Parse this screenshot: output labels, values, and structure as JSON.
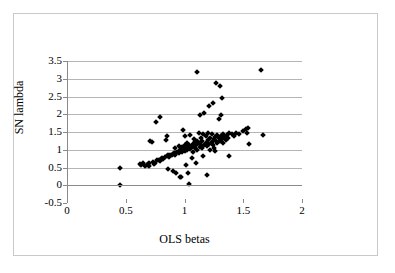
{
  "chart_data": {
    "type": "scatter",
    "title": "",
    "xlabel": "OLS betas",
    "ylabel": "SN lambda",
    "xlim": [
      0,
      2
    ],
    "ylim": [
      -0.5,
      3.5
    ],
    "xticks": [
      0,
      0.5,
      1,
      1.5,
      2
    ],
    "xtick_labels": [
      "0",
      "0.5",
      "1",
      "1.5",
      "2"
    ],
    "yticks": [
      -0.5,
      0,
      0.5,
      1,
      1.5,
      2,
      2.5,
      3,
      3.5
    ],
    "ytick_labels": [
      "-0.5",
      "0",
      "0.5",
      "1",
      "1.5",
      "2",
      "2.5",
      "3",
      "3.5"
    ],
    "grid": "horizontal",
    "legend": null,
    "marker": "diamond",
    "marker_color": "#000000",
    "points": [
      [
        0.45,
        0.49
      ],
      [
        0.45,
        0.0
      ],
      [
        0.62,
        0.6
      ],
      [
        0.63,
        0.58
      ],
      [
        0.65,
        0.62
      ],
      [
        0.66,
        0.55
      ],
      [
        0.68,
        0.57
      ],
      [
        0.69,
        0.6
      ],
      [
        0.7,
        0.54
      ],
      [
        0.7,
        0.63
      ],
      [
        0.71,
        1.24
      ],
      [
        0.72,
        1.22
      ],
      [
        0.73,
        0.66
      ],
      [
        0.74,
        0.6
      ],
      [
        0.75,
        0.62
      ],
      [
        0.76,
        1.78
      ],
      [
        0.77,
        0.7
      ],
      [
        0.78,
        0.72
      ],
      [
        0.79,
        0.68
      ],
      [
        0.79,
        1.93
      ],
      [
        0.8,
        0.75
      ],
      [
        0.81,
        0.78
      ],
      [
        0.82,
        0.74
      ],
      [
        0.83,
        0.8
      ],
      [
        0.84,
        1.27
      ],
      [
        0.85,
        0.82
      ],
      [
        0.85,
        1.4
      ],
      [
        0.86,
        0.46
      ],
      [
        0.86,
        0.84
      ],
      [
        0.87,
        0.8
      ],
      [
        0.88,
        0.86
      ],
      [
        0.89,
        0.84
      ],
      [
        0.9,
        0.88
      ],
      [
        0.9,
        0.4
      ],
      [
        0.91,
        0.9
      ],
      [
        0.92,
        0.86
      ],
      [
        0.92,
        1.05
      ],
      [
        0.93,
        0.92
      ],
      [
        0.93,
        0.35
      ],
      [
        0.94,
        0.95
      ],
      [
        0.95,
        0.9
      ],
      [
        0.95,
        1.1
      ],
      [
        0.96,
        0.24
      ],
      [
        0.96,
        0.98
      ],
      [
        0.97,
        0.22
      ],
      [
        0.97,
        1.02
      ],
      [
        0.98,
        0.94
      ],
      [
        0.98,
        1.08
      ],
      [
        0.99,
        1.0
      ],
      [
        0.99,
        1.56
      ],
      [
        1.0,
        0.96
      ],
      [
        1.0,
        1.12
      ],
      [
        1.0,
        1.38
      ],
      [
        1.01,
        1.04
      ],
      [
        1.01,
        0.58
      ],
      [
        1.02,
        1.0
      ],
      [
        1.02,
        1.2
      ],
      [
        1.03,
        0.35
      ],
      [
        1.03,
        1.06
      ],
      [
        1.04,
        0.04
      ],
      [
        1.04,
        1.14
      ],
      [
        1.05,
        1.02
      ],
      [
        1.05,
        1.42
      ],
      [
        1.06,
        1.08
      ],
      [
        1.06,
        0.78
      ],
      [
        1.07,
        1.16
      ],
      [
        1.07,
        0.95
      ],
      [
        1.08,
        1.1
      ],
      [
        1.08,
        1.3
      ],
      [
        1.09,
        1.05
      ],
      [
        1.09,
        1.22
      ],
      [
        1.1,
        1.12
      ],
      [
        1.1,
        0.64
      ],
      [
        1.11,
        3.18
      ],
      [
        1.11,
        1.0
      ],
      [
        1.11,
        1.26
      ],
      [
        1.12,
        1.18
      ],
      [
        1.12,
        1.46
      ],
      [
        1.13,
        1.08
      ],
      [
        1.13,
        1.97
      ],
      [
        1.14,
        1.14
      ],
      [
        1.14,
        1.34
      ],
      [
        1.15,
        1.05
      ],
      [
        1.15,
        1.24
      ],
      [
        1.16,
        1.44
      ],
      [
        1.16,
        0.82
      ],
      [
        1.17,
        1.12
      ],
      [
        1.17,
        2.03
      ],
      [
        1.18,
        1.2
      ],
      [
        1.18,
        1.4
      ],
      [
        1.19,
        1.1
      ],
      [
        1.19,
        0.28
      ],
      [
        1.2,
        1.28
      ],
      [
        1.2,
        1.48
      ],
      [
        1.21,
        1.16
      ],
      [
        1.21,
        2.22
      ],
      [
        1.22,
        1.32
      ],
      [
        1.22,
        1.0
      ],
      [
        1.23,
        1.22
      ],
      [
        1.23,
        1.44
      ],
      [
        1.24,
        1.14
      ],
      [
        1.24,
        2.33
      ],
      [
        1.25,
        1.3
      ],
      [
        1.25,
        1.05
      ],
      [
        1.26,
        1.36
      ],
      [
        1.26,
        0.96
      ],
      [
        1.27,
        1.26
      ],
      [
        1.27,
        2.88
      ],
      [
        1.28,
        1.18
      ],
      [
        1.28,
        1.42
      ],
      [
        1.29,
        1.32
      ],
      [
        1.29,
        1.86
      ],
      [
        1.3,
        1.24
      ],
      [
        1.3,
        2.8
      ],
      [
        1.31,
        1.38
      ],
      [
        1.31,
        1.97
      ],
      [
        1.32,
        1.3
      ],
      [
        1.32,
        2.46
      ],
      [
        1.33,
        1.44
      ],
      [
        1.33,
        1.2
      ],
      [
        1.34,
        1.36
      ],
      [
        1.35,
        1.28
      ],
      [
        1.36,
        1.42
      ],
      [
        1.37,
        1.34
      ],
      [
        1.38,
        1.46
      ],
      [
        1.38,
        0.82
      ],
      [
        1.4,
        1.44
      ],
      [
        1.42,
        1.4
      ],
      [
        1.44,
        1.47
      ],
      [
        1.46,
        1.43
      ],
      [
        1.5,
        1.52
      ],
      [
        1.52,
        1.58
      ],
      [
        1.53,
        1.48
      ],
      [
        1.54,
        1.6
      ],
      [
        1.55,
        1.15
      ],
      [
        1.65,
        3.25
      ],
      [
        1.67,
        1.42
      ]
    ]
  }
}
